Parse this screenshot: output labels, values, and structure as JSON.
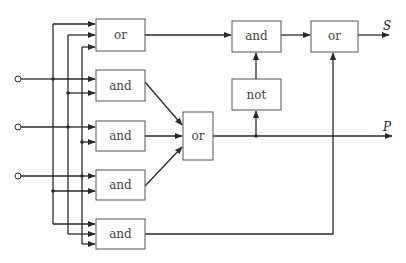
{
  "diagram": {
    "type": "logic-circuit",
    "gates": [
      {
        "id": "or_top",
        "label": "or"
      },
      {
        "id": "and_1",
        "label": "and"
      },
      {
        "id": "and_2",
        "label": "and"
      },
      {
        "id": "and_3",
        "label": "and"
      },
      {
        "id": "and_bottom",
        "label": "and"
      },
      {
        "id": "or_mid",
        "label": "or"
      },
      {
        "id": "not",
        "label": "not"
      },
      {
        "id": "and_top",
        "label": "and"
      },
      {
        "id": "or_out",
        "label": "or"
      }
    ],
    "inputs": [
      "input-1",
      "input-2",
      "input-3"
    ],
    "outputs": {
      "s": "S",
      "p": "P"
    }
  }
}
